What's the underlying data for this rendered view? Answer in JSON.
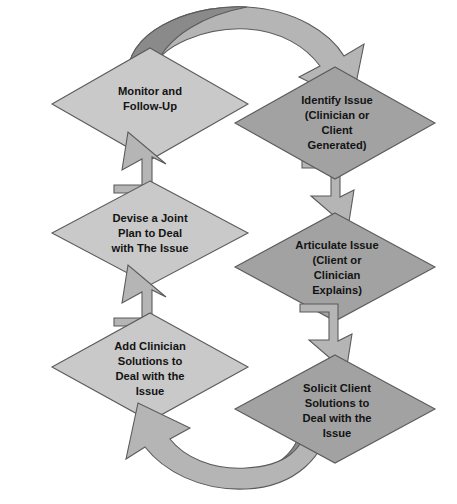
{
  "diagram": {
    "type": "cyclical-flow-diagram",
    "colors": {
      "background": "#ffffff",
      "node_light_fill": "#c9c9c9",
      "node_dark_fill": "#a2a2a2",
      "arrow_fill": "#b5b5b5",
      "arrow_shadow_fill": "#8a8a8a",
      "outline": "#5b5b5b",
      "text": "#131313"
    },
    "nodes": [
      {
        "id": "monitor-and-follow-up",
        "column": "left",
        "order": 1,
        "shade": "light",
        "lines": [
          "Monitor and",
          "Follow-Up"
        ],
        "cx": 150,
        "cy": 104,
        "rx": 98,
        "ry": 56
      },
      {
        "id": "identify-issue",
        "column": "right",
        "order": 2,
        "shade": "dark",
        "lines": [
          "Identify Issue",
          "(Clinician or",
          "Client",
          "Generated)"
        ],
        "cx": 335,
        "cy": 123,
        "rx": 100,
        "ry": 56
      },
      {
        "id": "devise-a-joint-plan",
        "column": "left",
        "order": 5,
        "shade": "light",
        "lines": [
          "Devise a Joint",
          "Plan to Deal",
          "with The Issue"
        ],
        "cx": 150,
        "cy": 233,
        "rx": 98,
        "ry": 52
      },
      {
        "id": "articulate-issue",
        "column": "right",
        "order": 3,
        "shade": "dark",
        "lines": [
          "Articulate Issue",
          "(Client or",
          "Clinician",
          "Explains)"
        ],
        "cx": 335,
        "cy": 267,
        "rx": 100,
        "ry": 54
      },
      {
        "id": "add-clinician-solutions",
        "column": "left",
        "order": 6,
        "shade": "light",
        "lines": [
          "Add Clinician",
          "Solutions to",
          "Deal with the",
          "Issue"
        ],
        "cx": 150,
        "cy": 367,
        "rx": 98,
        "ry": 54
      },
      {
        "id": "solicit-client-solutions",
        "column": "right",
        "order": 4,
        "shade": "dark",
        "lines": [
          "Solicit Client",
          "Solutions to",
          "Deal with the",
          "Issue"
        ],
        "cx": 335,
        "cy": 409,
        "rx": 100,
        "ry": 54
      }
    ],
    "connectors": [
      {
        "id": "top-curved-arrow",
        "kind": "curved-arc",
        "from": "monitor-and-follow-up",
        "to": "identify-issue",
        "direction": "left-to-right-over-top"
      },
      {
        "id": "arrow-identify-to-articulate",
        "kind": "bent-block-arrow",
        "from": "identify-issue",
        "to": "articulate-issue",
        "direction": "down-right"
      },
      {
        "id": "arrow-articulate-to-solicit",
        "kind": "bent-block-arrow",
        "from": "articulate-issue",
        "to": "solicit-client-solutions",
        "direction": "down-right"
      },
      {
        "id": "bottom-curved-arrow",
        "kind": "curved-arc",
        "from": "solicit-client-solutions",
        "to": "add-clinician-solutions",
        "direction": "right-to-left-under-bottom"
      },
      {
        "id": "arrow-add-clinician-to-devise",
        "kind": "bent-block-arrow",
        "from": "add-clinician-solutions",
        "to": "devise-a-joint-plan",
        "direction": "up-left"
      },
      {
        "id": "arrow-devise-to-monitor",
        "kind": "bent-block-arrow",
        "from": "devise-a-joint-plan",
        "to": "monitor-and-follow-up",
        "direction": "up-left"
      }
    ]
  }
}
